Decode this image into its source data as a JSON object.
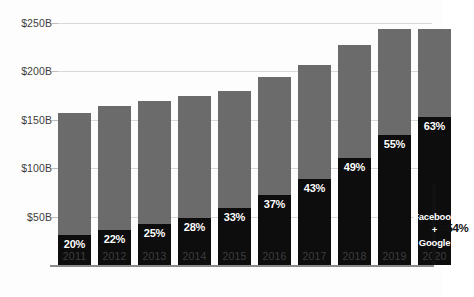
{
  "chart_data": {
    "type": "bar",
    "title": "",
    "subtitle": "",
    "xlabel": "",
    "ylabel": "",
    "categories": [
      "2011",
      "2012",
      "2013",
      "2014",
      "2015",
      "2016",
      "2017",
      "2018",
      "2019",
      "2020"
    ],
    "ylim": [
      0,
      250
    ],
    "yticks": [
      50,
      100,
      150,
      200,
      250
    ],
    "ytick_labels": [
      "$50B",
      "$100B",
      "$150B",
      "$200B",
      "$250B"
    ],
    "grid": true,
    "legend": "none",
    "stacked": true,
    "series": [
      {
        "name": "Duopoly share (Facebook + Google)",
        "color": "#0d0d0d",
        "values": [
          31,
          36,
          42,
          49,
          59,
          72,
          89,
          111,
          134,
          153
        ],
        "data_labels": [
          "20%",
          "22%",
          "25%",
          "28%",
          "33%",
          "37%",
          "43%",
          "49%",
          "55%",
          "63%"
        ]
      },
      {
        "name": "Other digital ad spend",
        "color": "#6b6b6b",
        "values": [
          126,
          128,
          127,
          126,
          121,
          122,
          118,
          116,
          110,
          91
        ]
      }
    ],
    "totals": [
      157,
      164,
      169,
      175,
      180,
      194,
      207,
      227,
      244,
      244
    ],
    "share_percentages": [
      20,
      22,
      25,
      28,
      33,
      37,
      43,
      49,
      55,
      63
    ],
    "annotation": {
      "line1": "Facebook",
      "line2": "+",
      "line3": "Google",
      "value": "=54%"
    }
  },
  "colors": {
    "bar_dark": "#0d0d0d",
    "bar_gray": "#6b6b6b",
    "gridline": "#d8d8d8",
    "axis": "#8a8a8a",
    "text": "#3d3d3d",
    "background": "#fdfdfd"
  }
}
